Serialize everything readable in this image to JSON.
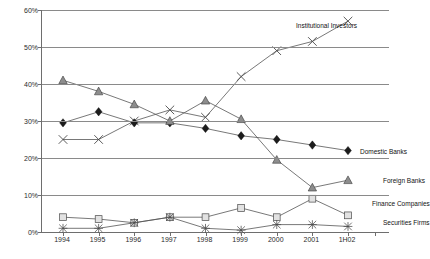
{
  "chart_data": {
    "type": "line",
    "title": "",
    "xlabel": "",
    "ylabel": "Share of Market",
    "categories": [
      "1994",
      "1995",
      "1996",
      "1997",
      "1998",
      "1999",
      "2000",
      "2001",
      "1H02"
    ],
    "ylim": [
      0,
      60
    ],
    "ytick_labels": [
      "0%",
      "10%",
      "20%",
      "30%",
      "40%",
      "50%",
      "60%"
    ],
    "ytick_values": [
      0,
      10,
      20,
      30,
      40,
      50,
      60
    ],
    "grid": true,
    "legend_position": "inline-annotations",
    "series": [
      {
        "name": "Institutional Investors",
        "marker": "x",
        "values": [
          25,
          25,
          30,
          33,
          31,
          42,
          49,
          51.5,
          57
        ]
      },
      {
        "name": "Domestic Banks",
        "marker": "diamond",
        "values": [
          29.5,
          32.5,
          29.5,
          29.5,
          28,
          26,
          25,
          23.5,
          22
        ]
      },
      {
        "name": "Foreign Banks",
        "marker": "triangle",
        "values": [
          41,
          38,
          34.5,
          30,
          35.5,
          30.5,
          19.5,
          12,
          14
        ]
      },
      {
        "name": "Finance Companies",
        "marker": "square",
        "values": [
          4,
          3.5,
          2.5,
          4,
          4,
          6.5,
          4,
          9,
          4.5
        ]
      },
      {
        "name": "Securities Firms",
        "marker": "star",
        "values": [
          1,
          1,
          2.5,
          4,
          1,
          0.5,
          2,
          2,
          1.5
        ]
      }
    ],
    "annotations": [
      {
        "text": "Institutional Investors",
        "x": 296,
        "y": 22
      },
      {
        "text": "Domestic Banks",
        "x": 360,
        "y": 148
      },
      {
        "text": "Foreign Banks",
        "x": 383,
        "y": 177
      },
      {
        "text": "Finance Companies",
        "x": 372,
        "y": 200
      },
      {
        "text": "Securities Firms",
        "x": 383,
        "y": 219
      }
    ]
  },
  "colors": {
    "axis": "#6e6e6e",
    "grid": "#8a8a8a",
    "line": "#555555",
    "diamond": "#1c1c1c",
    "triangle": "#8d8d8d",
    "square": "#e2e2e2",
    "text": "#1a1a1a",
    "background": "#ffffff"
  }
}
